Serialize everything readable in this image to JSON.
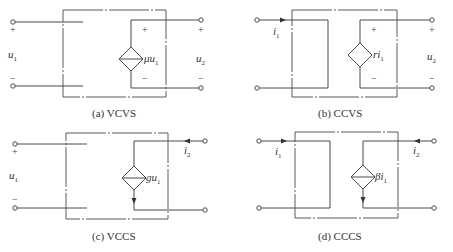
{
  "figure": {
    "panels": [
      {
        "id": "a",
        "caption": "(a) VCVS",
        "type": "Voltage-Controlled Voltage Source",
        "source_label": "μu",
        "source_label_sub": "1",
        "left_label": "u",
        "left_label_sub": "1",
        "right_label": "u",
        "right_label_sub": "2",
        "plus": "+",
        "minus": "−"
      },
      {
        "id": "b",
        "caption": "(b) CCVS",
        "type": "Current-Controlled Voltage Source",
        "source_label": "ri",
        "source_label_sub": "1",
        "left_label": "i",
        "left_label_sub": "1",
        "right_label": "u",
        "right_label_sub": "2",
        "plus": "+",
        "minus": "−"
      },
      {
        "id": "c",
        "caption": "(c) VCCS",
        "type": "Voltage-Controlled Current Source",
        "source_label": "gu",
        "source_label_sub": "1",
        "left_label": "u",
        "left_label_sub": "1",
        "right_label": "i",
        "right_label_sub": "2",
        "plus": "+",
        "minus": "−"
      },
      {
        "id": "d",
        "caption": "(d) CCCS",
        "type": "Current-Controlled Current Source",
        "source_label": "βi",
        "source_label_sub": "1",
        "left_label": "i",
        "left_label_sub": "1",
        "right_label": "i",
        "right_label_sub": "2"
      }
    ]
  }
}
